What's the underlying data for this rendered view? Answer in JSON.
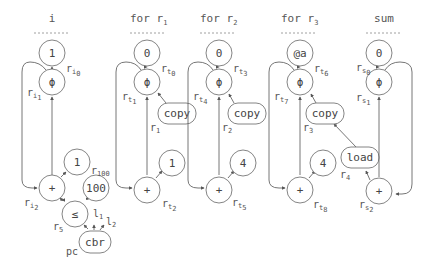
{
  "columns": [
    {
      "id": "i",
      "title": "i",
      "x": 52
    },
    {
      "id": "for_r1",
      "title": "for r",
      "title_sub": "1",
      "x": 147
    },
    {
      "id": "for_r2",
      "title": "for r",
      "title_sub": "2",
      "x": 219
    },
    {
      "id": "for_r3",
      "title": "for r",
      "title_sub": "3",
      "x": 300
    },
    {
      "id": "sum",
      "title": "sum",
      "x": 379
    }
  ],
  "nodes": {
    "i_init": {
      "label": "1"
    },
    "i_phi": {
      "label": "ϕ"
    },
    "i_plus": {
      "label": "+"
    },
    "i_one": {
      "label": "1"
    },
    "i_hundred": {
      "label": "100"
    },
    "i_le": {
      "label": "≤"
    },
    "i_cbr": {
      "label": "cbr"
    },
    "r1_init": {
      "label": "0"
    },
    "r1_phi": {
      "label": "ϕ"
    },
    "r1_copy": {
      "label": "copy"
    },
    "r1_plus": {
      "label": "+"
    },
    "r1_one": {
      "label": "1"
    },
    "r2_init": {
      "label": "0"
    },
    "r2_phi": {
      "label": "ϕ"
    },
    "r2_copy": {
      "label": "copy"
    },
    "r2_plus": {
      "label": "+"
    },
    "r2_four": {
      "label": "4"
    },
    "r3_init": {
      "label": "@a"
    },
    "r3_phi": {
      "label": "ϕ"
    },
    "r3_copy": {
      "label": "copy"
    },
    "r3_plus": {
      "label": "+"
    },
    "r3_four": {
      "label": "4"
    },
    "load": {
      "label": "load"
    },
    "sum_init": {
      "label": "0"
    },
    "sum_phi": {
      "label": "ϕ"
    },
    "sum_plus": {
      "label": "+"
    }
  },
  "registers": {
    "ri0": {
      "base": "r",
      "sub": "i",
      "subsub": "0"
    },
    "ri1": {
      "base": "r",
      "sub": "i",
      "subsub": "1"
    },
    "ri2": {
      "base": "r",
      "sub": "i",
      "subsub": "2"
    },
    "r100": {
      "base": "r",
      "sub": "100"
    },
    "r5": {
      "base": "r",
      "sub": "5"
    },
    "l1": {
      "base": "l",
      "sub": "1"
    },
    "l2": {
      "base": "l",
      "sub": "2"
    },
    "pc": {
      "base": "pc"
    },
    "rt0": {
      "base": "r",
      "sub": "t",
      "subsub": "0"
    },
    "rt1": {
      "base": "r",
      "sub": "t",
      "subsub": "1"
    },
    "r1": {
      "base": "r",
      "sub": "1"
    },
    "rt2": {
      "base": "r",
      "sub": "t",
      "subsub": "2"
    },
    "rt3": {
      "base": "r",
      "sub": "t",
      "subsub": "3"
    },
    "rt4": {
      "base": "r",
      "sub": "t",
      "subsub": "4"
    },
    "r2": {
      "base": "r",
      "sub": "2"
    },
    "rt5": {
      "base": "r",
      "sub": "t",
      "subsub": "5"
    },
    "rt6": {
      "base": "r",
      "sub": "t",
      "subsub": "6"
    },
    "rt7": {
      "base": "r",
      "sub": "t",
      "subsub": "7"
    },
    "r3": {
      "base": "r",
      "sub": "3"
    },
    "rt8": {
      "base": "r",
      "sub": "t",
      "subsub": "8"
    },
    "r4": {
      "base": "r",
      "sub": "4"
    },
    "rs0": {
      "base": "r",
      "sub": "s",
      "subsub": "0"
    },
    "rs1": {
      "base": "r",
      "sub": "s",
      "subsub": "1"
    },
    "rs2": {
      "base": "r",
      "sub": "s",
      "subsub": "2"
    }
  }
}
